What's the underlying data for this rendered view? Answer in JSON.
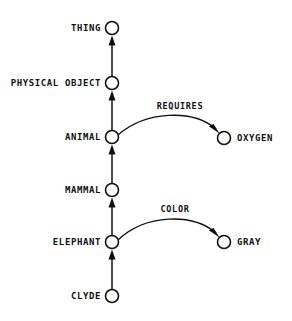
{
  "diagram": {
    "background_color": "#ffffff",
    "ink_color": "#111111",
    "nodes": [
      {
        "id": "thing",
        "label": "THING",
        "cx": 112,
        "cy": 28,
        "r": 6.5,
        "label_anchor": "end",
        "label_x": 101,
        "label_y": 31
      },
      {
        "id": "physical",
        "label": "PHYSICAL OBJECT",
        "cx": 112,
        "cy": 83,
        "r": 6.5,
        "label_anchor": "end",
        "label_x": 101,
        "label_y": 86
      },
      {
        "id": "animal",
        "label": "ANIMAL",
        "cx": 112,
        "cy": 137,
        "r": 6.5,
        "label_anchor": "end",
        "label_x": 101,
        "label_y": 140
      },
      {
        "id": "mammal",
        "label": "MAMMAL",
        "cx": 112,
        "cy": 190,
        "r": 6.5,
        "label_anchor": "end",
        "label_x": 101,
        "label_y": 193
      },
      {
        "id": "elephant",
        "label": "ELEPHANT",
        "cx": 112,
        "cy": 242,
        "r": 6.5,
        "label_anchor": "end",
        "label_x": 101,
        "label_y": 245
      },
      {
        "id": "clyde",
        "label": "CLYDE",
        "cx": 112,
        "cy": 296,
        "r": 6.5,
        "label_anchor": "end",
        "label_x": 101,
        "label_y": 299
      },
      {
        "id": "oxygen",
        "label": "OXYGEN",
        "cx": 224,
        "cy": 138,
        "r": 6.5,
        "label_anchor": "start",
        "label_x": 237,
        "label_y": 141
      },
      {
        "id": "gray",
        "label": "GRAY",
        "cx": 224,
        "cy": 242,
        "r": 6.5,
        "label_anchor": "start",
        "label_x": 237,
        "label_y": 245
      }
    ],
    "edges": [
      {
        "id": "clyde-elephant",
        "from": "clyde",
        "to": "elephant",
        "label": "",
        "kind": "straight"
      },
      {
        "id": "elephant-mammal",
        "from": "elephant",
        "to": "mammal",
        "label": "",
        "kind": "straight"
      },
      {
        "id": "mammal-animal",
        "from": "mammal",
        "to": "animal",
        "label": "",
        "kind": "straight"
      },
      {
        "id": "animal-physical",
        "from": "animal",
        "to": "physical",
        "label": "",
        "kind": "straight"
      },
      {
        "id": "physical-thing",
        "from": "physical",
        "to": "thing",
        "label": "",
        "kind": "straight"
      },
      {
        "id": "animal-oxygen",
        "from": "animal",
        "to": "oxygen",
        "label": "REQUIRES",
        "kind": "arc",
        "label_x": 180,
        "label_y": 109
      },
      {
        "id": "elephant-gray",
        "from": "elephant",
        "to": "gray",
        "label": "COLOR",
        "kind": "arc",
        "label_x": 175,
        "label_y": 212
      }
    ]
  }
}
